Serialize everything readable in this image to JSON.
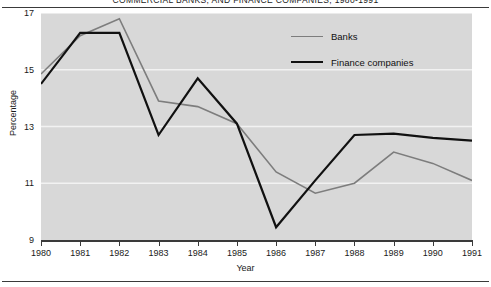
{
  "chart_data": {
    "type": "line",
    "title": "COMMERCIAL BANKS, AND FINANCE COMPANIES, 1980-1991",
    "xlabel": "Year",
    "ylabel": "Percentage",
    "categories": [
      "1980",
      "1981",
      "1982",
      "1983",
      "1984",
      "1985",
      "1986",
      "1987",
      "1988",
      "1989",
      "1990",
      "1991"
    ],
    "x": [
      1980,
      1981,
      1982,
      1983,
      1984,
      1985,
      1986,
      1987,
      1988,
      1989,
      1990,
      1991
    ],
    "xlim": [
      1980,
      1991
    ],
    "ylim": [
      9,
      17
    ],
    "yticks": [
      9,
      11,
      13,
      15,
      17
    ],
    "ytick_labels": [
      "9",
      "11",
      "13",
      "15",
      "17"
    ],
    "grid": "horizontal-white-gridlines",
    "legend_position": "top-right-inside",
    "plot_background": "#d8d8d8",
    "series": [
      {
        "name": "Banks",
        "color": "#7d7d7d",
        "line_width": 1.6,
        "values": [
          14.85,
          16.2,
          16.8,
          13.9,
          13.7,
          13.1,
          11.4,
          10.65,
          11.0,
          12.1,
          11.7,
          11.1
        ]
      },
      {
        "name": "Finance companies",
        "color": "#111111",
        "line_width": 2.2,
        "values": [
          14.5,
          16.3,
          16.3,
          12.7,
          14.7,
          13.1,
          9.45,
          11.1,
          12.7,
          12.75,
          12.6,
          12.5
        ]
      }
    ]
  },
  "legend": {
    "items": [
      {
        "label": "Banks",
        "color": "#7d7d7d",
        "width": 1.8
      },
      {
        "label": "Finance companies",
        "color": "#111111",
        "width": 2.4
      }
    ]
  },
  "colors": {
    "plot_bg": "#d8d8d8",
    "gridline": "#f2f2f2",
    "axis": "#3a3a3a",
    "text": "#1a1a1a"
  }
}
